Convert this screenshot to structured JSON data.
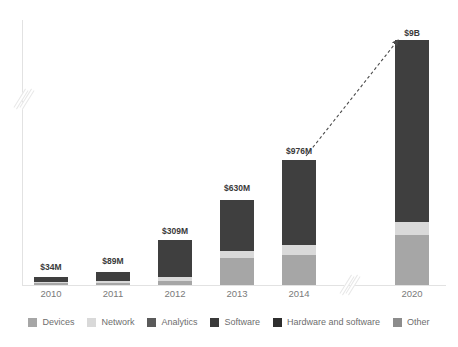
{
  "chart_data": {
    "type": "bar",
    "title": "",
    "subtitle": "",
    "xlabel": "",
    "ylabel": "",
    "stacked": true,
    "grid": false,
    "legend_position": "bottom",
    "axis_breaks": {
      "y_axis": true,
      "x_axis": true
    },
    "categories": [
      "2010",
      "2011",
      "2012",
      "2013",
      "2014",
      "2020"
    ],
    "data_labels": [
      "$34M",
      "$89M",
      "$309M",
      "$630M",
      "$976M",
      "$9B"
    ],
    "values": [
      34,
      89,
      309,
      630,
      976,
      9000
    ],
    "value_unit": "USD millions",
    "series": [
      {
        "name": "Devices",
        "color": "#a6a6a6",
        "values": [
          4,
          10,
          28,
          120,
          180,
          1600
        ]
      },
      {
        "name": "Network",
        "color": "#d9d9d9",
        "values": [
          3,
          7,
          20,
          60,
          120,
          520
        ]
      },
      {
        "name": "Hardware and software",
        "color": "#3f3f3f",
        "values": [
          27,
          72,
          261,
          450,
          676,
          6880
        ]
      }
    ],
    "annotation": {
      "type": "dashed-arrow",
      "from": "2014",
      "to": "2020",
      "label": ""
    }
  },
  "legend": {
    "items": [
      {
        "label": "Devices",
        "color": "#a6a6a6"
      },
      {
        "label": "Network",
        "color": "#d9d9d9"
      },
      {
        "label": "Analytics",
        "color": "#5a5a5a"
      },
      {
        "label": "Software",
        "color": "#3a3a3a"
      },
      {
        "label": "Hardware and software",
        "color": "#2e2e2e"
      },
      {
        "label": "Other",
        "color": "#8c8c8c"
      }
    ]
  },
  "bars": [
    {
      "category": "2010",
      "label": "$34M",
      "center_x": 51,
      "width": 34,
      "label_y": 262,
      "segments": [
        {
          "name": "Devices",
          "color": "#a6a6a6",
          "height": 2
        },
        {
          "name": "Network",
          "color": "#d9d9d9",
          "height": 1
        },
        {
          "name": "Hardware and software",
          "color": "#3f3f3f",
          "height": 5
        }
      ]
    },
    {
      "category": "2011",
      "label": "$89M",
      "center_x": 113,
      "width": 34,
      "label_y": 256,
      "segments": [
        {
          "name": "Devices",
          "color": "#a6a6a6",
          "height": 2
        },
        {
          "name": "Network",
          "color": "#d9d9d9",
          "height": 2
        },
        {
          "name": "Hardware and software",
          "color": "#3f3f3f",
          "height": 9
        }
      ]
    },
    {
      "category": "2012",
      "label": "$309M",
      "center_x": 175,
      "width": 34,
      "label_y": 226,
      "segments": [
        {
          "name": "Devices",
          "color": "#a6a6a6",
          "height": 4
        },
        {
          "name": "Network",
          "color": "#d9d9d9",
          "height": 4
        },
        {
          "name": "Hardware and software",
          "color": "#3f3f3f",
          "height": 37
        }
      ]
    },
    {
      "category": "2013",
      "label": "$630M",
      "center_x": 237,
      "width": 34,
      "label_y": 183,
      "segments": [
        {
          "name": "Devices",
          "color": "#a6a6a6",
          "height": 27
        },
        {
          "name": "Network",
          "color": "#d9d9d9",
          "height": 7
        },
        {
          "name": "Hardware and software",
          "color": "#3f3f3f",
          "height": 51
        }
      ]
    },
    {
      "category": "2014",
      "label": "$976M",
      "center_x": 299,
      "width": 34,
      "label_y": 146,
      "segments": [
        {
          "name": "Devices",
          "color": "#a6a6a6",
          "height": 30
        },
        {
          "name": "Network",
          "color": "#d9d9d9",
          "height": 10
        },
        {
          "name": "Hardware and software",
          "color": "#3f3f3f",
          "height": 85
        }
      ]
    },
    {
      "category": "2020",
      "label": "$9B",
      "center_x": 412,
      "width": 34,
      "label_y": 28,
      "segments": [
        {
          "name": "Devices",
          "color": "#a6a6a6",
          "height": 50
        },
        {
          "name": "Network",
          "color": "#d9d9d9",
          "height": 13
        },
        {
          "name": "Hardware and software",
          "color": "#3f3f3f",
          "height": 182
        }
      ]
    }
  ]
}
